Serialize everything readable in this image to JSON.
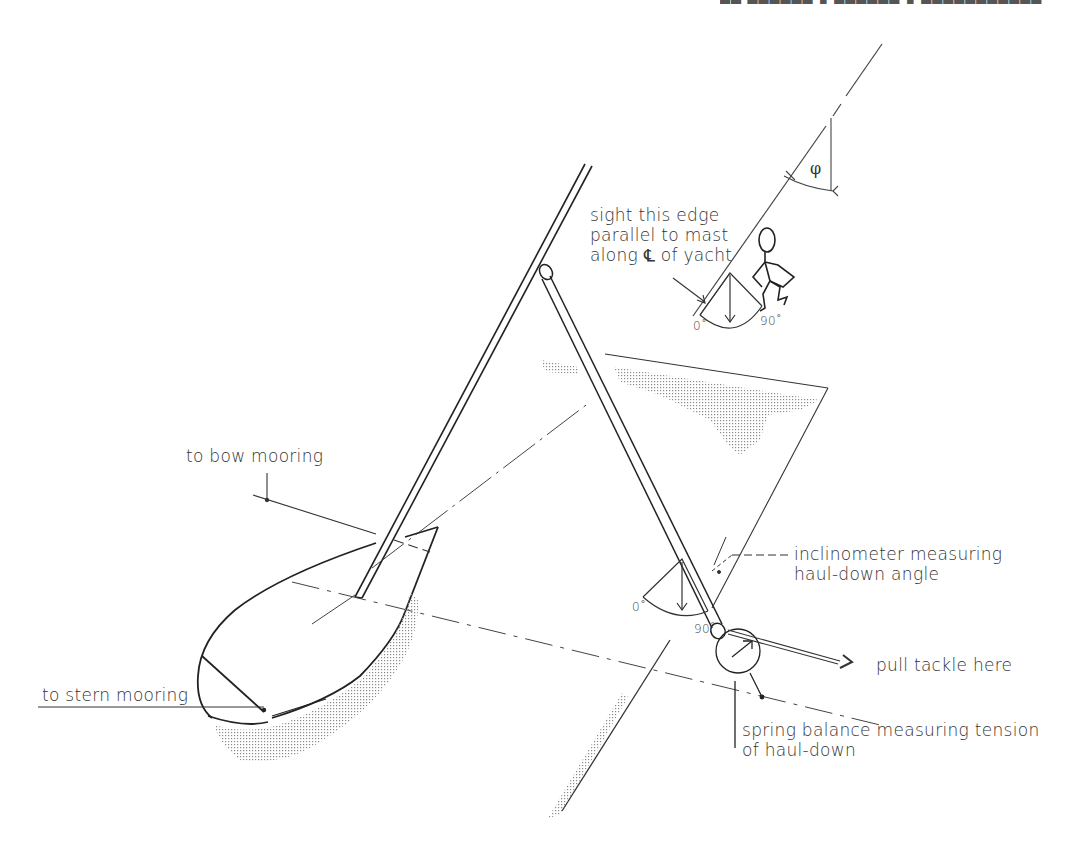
{
  "figure": {
    "header_fragment": "(cropped running header at top edge)"
  },
  "labels": {
    "sight_edge": [
      "sight this edge",
      "parallel to mast",
      "along ℄ of yacht"
    ],
    "bow_mooring": "to bow mooring",
    "stern_mooring": "to stern mooring",
    "inclinometer": [
      "inclinometer measuring",
      "haul-down angle"
    ],
    "pull_tackle": "pull tackle here",
    "spring_balance": [
      "spring balance measuring tension",
      "of haul-down"
    ],
    "phi": "φ",
    "upper_inclinometer_scale": {
      "min": "0˚",
      "max": "90˚"
    },
    "lower_inclinometer_scale": {
      "min": "0˚",
      "max": "90˚"
    }
  },
  "colors": {
    "line": "#333333",
    "shade": "#9a9a9a",
    "background": "#ffffff"
  }
}
